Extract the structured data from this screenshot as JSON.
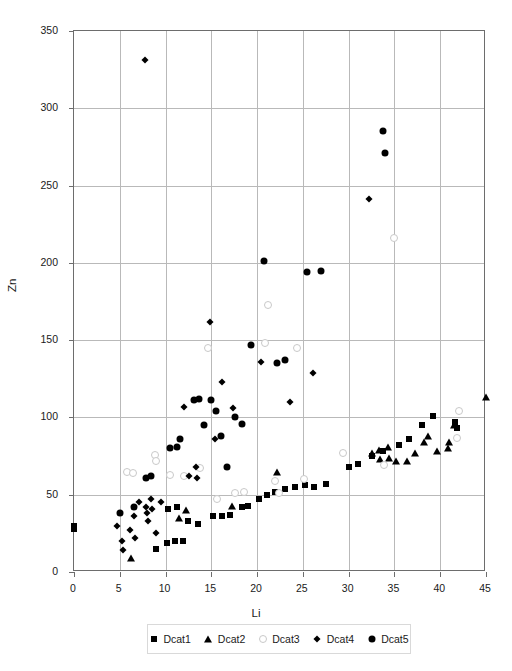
{
  "chart_data": {
    "type": "scatter",
    "title": "",
    "xlabel": "Li",
    "ylabel": "Zn",
    "xlim": [
      0,
      45
    ],
    "ylim": [
      0,
      350
    ],
    "xticks": [
      0,
      5,
      10,
      15,
      20,
      25,
      30,
      35,
      40,
      45
    ],
    "yticks": [
      0,
      50,
      100,
      150,
      200,
      250,
      300,
      350
    ],
    "grid": true,
    "legend_position": "bottom",
    "series": [
      {
        "name": "Dcat1",
        "marker": "filled-square",
        "color": "#000000",
        "points": [
          [
            0.0,
            30
          ],
          [
            0.0,
            28
          ],
          [
            9.0,
            15
          ],
          [
            10.2,
            19
          ],
          [
            11.0,
            20
          ],
          [
            11.9,
            20
          ],
          [
            10.3,
            41
          ],
          [
            11.3,
            42
          ],
          [
            12.5,
            33
          ],
          [
            13.5,
            31
          ],
          [
            15.2,
            36
          ],
          [
            16.2,
            36
          ],
          [
            17.0,
            37
          ],
          [
            18.3,
            42
          ],
          [
            19.0,
            43
          ],
          [
            20.2,
            47
          ],
          [
            21.1,
            50
          ],
          [
            22.0,
            52
          ],
          [
            23.0,
            54
          ],
          [
            24.1,
            55
          ],
          [
            25.2,
            56
          ],
          [
            26.2,
            55
          ],
          [
            27.5,
            57
          ],
          [
            30.0,
            68
          ],
          [
            31.0,
            70
          ],
          [
            32.5,
            75
          ],
          [
            33.8,
            78
          ],
          [
            35.5,
            82
          ],
          [
            36.6,
            86
          ],
          [
            38.0,
            95
          ],
          [
            39.2,
            101
          ],
          [
            41.6,
            97
          ],
          [
            41.8,
            93
          ]
        ]
      },
      {
        "name": "Dcat2",
        "marker": "filled-triangle",
        "color": "#000000",
        "points": [
          [
            6.2,
            9
          ],
          [
            11.5,
            35
          ],
          [
            12.2,
            40
          ],
          [
            17.3,
            43
          ],
          [
            22.2,
            65
          ],
          [
            32.5,
            77
          ],
          [
            33.3,
            79
          ],
          [
            33.4,
            73
          ],
          [
            34.3,
            81
          ],
          [
            34.4,
            74
          ],
          [
            35.2,
            72
          ],
          [
            36.4,
            72
          ],
          [
            37.2,
            77
          ],
          [
            38.2,
            84
          ],
          [
            38.7,
            88
          ],
          [
            39.7,
            78
          ],
          [
            40.9,
            80
          ],
          [
            41.0,
            84
          ],
          [
            41.5,
            95
          ],
          [
            45.0,
            113
          ]
        ]
      },
      {
        "name": "Dcat3",
        "marker": "open-circle",
        "color": "#cccccc",
        "points": [
          [
            5.8,
            65
          ],
          [
            6.4,
            64
          ],
          [
            8.8,
            76
          ],
          [
            9.0,
            72
          ],
          [
            10.5,
            63
          ],
          [
            12.0,
            62
          ],
          [
            13.8,
            67
          ],
          [
            14.6,
            145
          ],
          [
            15.6,
            47
          ],
          [
            17.6,
            51
          ],
          [
            18.6,
            52
          ],
          [
            20.9,
            148
          ],
          [
            21.2,
            173
          ],
          [
            22.0,
            59
          ],
          [
            22.4,
            51
          ],
          [
            24.4,
            145
          ],
          [
            25.1,
            60
          ],
          [
            29.4,
            77
          ],
          [
            33.9,
            69
          ],
          [
            35.0,
            216
          ],
          [
            42.0,
            104
          ],
          [
            41.8,
            87
          ]
        ]
      },
      {
        "name": "Dcat4",
        "marker": "filled-diamond",
        "color": "#000000",
        "points": [
          [
            4.7,
            30
          ],
          [
            5.2,
            20
          ],
          [
            5.3,
            14
          ],
          [
            6.1,
            27
          ],
          [
            6.6,
            36
          ],
          [
            6.7,
            22
          ],
          [
            7.1,
            45
          ],
          [
            7.8,
            331
          ],
          [
            7.9,
            42
          ],
          [
            8.0,
            38
          ],
          [
            8.1,
            33
          ],
          [
            8.4,
            47
          ],
          [
            8.5,
            41
          ],
          [
            9.0,
            25
          ],
          [
            9.5,
            45
          ],
          [
            12.0,
            107
          ],
          [
            12.6,
            62
          ],
          [
            13.3,
            68
          ],
          [
            13.4,
            61
          ],
          [
            14.8,
            162
          ],
          [
            15.4,
            86
          ],
          [
            16.2,
            123
          ],
          [
            17.4,
            106
          ],
          [
            20.4,
            136
          ],
          [
            23.6,
            110
          ],
          [
            26.1,
            129
          ],
          [
            32.2,
            241
          ]
        ]
      },
      {
        "name": "Dcat5",
        "marker": "filled-circle",
        "color": "#000000",
        "points": [
          [
            5.0,
            38
          ],
          [
            6.5,
            42
          ],
          [
            7.9,
            61
          ],
          [
            8.4,
            62
          ],
          [
            10.5,
            80
          ],
          [
            11.3,
            81
          ],
          [
            11.6,
            86
          ],
          [
            13.1,
            111
          ],
          [
            13.6,
            112
          ],
          [
            14.2,
            95
          ],
          [
            15.0,
            111
          ],
          [
            15.5,
            104
          ],
          [
            16.1,
            88
          ],
          [
            16.7,
            68
          ],
          [
            17.6,
            100
          ],
          [
            18.4,
            96
          ],
          [
            19.3,
            147
          ],
          [
            20.7,
            201
          ],
          [
            22.2,
            135
          ],
          [
            23.0,
            137
          ],
          [
            25.4,
            194
          ],
          [
            27.0,
            195
          ],
          [
            33.8,
            285
          ],
          [
            34.0,
            271
          ]
        ]
      }
    ]
  },
  "legend": {
    "items": [
      {
        "label": "Dcat1",
        "marker": "filled-square"
      },
      {
        "label": "Dcat2",
        "marker": "filled-triangle"
      },
      {
        "label": "Dcat3",
        "marker": "open-circle"
      },
      {
        "label": "Dcat4",
        "marker": "filled-diamond"
      },
      {
        "label": "Dcat5",
        "marker": "filled-circle"
      }
    ]
  }
}
